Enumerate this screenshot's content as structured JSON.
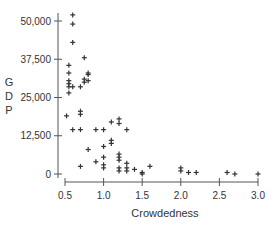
{
  "chart_data": {
    "type": "scatter",
    "title": "",
    "xlabel": "Crowdedness",
    "ylabel": "GDP",
    "ylabel_letters": [
      "G",
      "D",
      "P"
    ],
    "xlim": [
      0.5,
      3.0
    ],
    "ylim": [
      0,
      50000
    ],
    "x_ticks": [
      0.5,
      1.0,
      1.5,
      2.0,
      2.5,
      3.0
    ],
    "x_tick_labels": [
      "0.5",
      "1.0",
      "1.5",
      "2.0",
      "2.5",
      "3.0"
    ],
    "y_ticks": [
      0,
      12500,
      25000,
      37500,
      50000
    ],
    "y_tick_labels": [
      "0",
      "12,500",
      "25,000",
      "37,500",
      "50,000"
    ],
    "grid": false,
    "legend": null,
    "marker": "+",
    "marker_color": "#333333",
    "points": [
      [
        0.6,
        52000
      ],
      [
        0.6,
        49000
      ],
      [
        0.6,
        43000
      ],
      [
        0.55,
        35500
      ],
      [
        0.55,
        33000
      ],
      [
        0.55,
        30500
      ],
      [
        0.55,
        29500
      ],
      [
        0.55,
        28500
      ],
      [
        0.55,
        26500
      ],
      [
        0.52,
        19000
      ],
      [
        0.6,
        28500
      ],
      [
        0.7,
        28500
      ],
      [
        0.75,
        38000
      ],
      [
        0.8,
        33000
      ],
      [
        0.8,
        30500
      ],
      [
        0.75,
        31000
      ],
      [
        0.75,
        30000
      ],
      [
        0.8,
        32500
      ],
      [
        0.7,
        20500
      ],
      [
        0.7,
        19500
      ],
      [
        0.7,
        14500
      ],
      [
        0.6,
        14500
      ],
      [
        0.9,
        14500
      ],
      [
        1.0,
        14500
      ],
      [
        0.8,
        8000
      ],
      [
        0.9,
        4000
      ],
      [
        0.7,
        2500
      ],
      [
        1.0,
        9000
      ],
      [
        1.0,
        5500
      ],
      [
        1.0,
        3000
      ],
      [
        1.0,
        2000
      ],
      [
        1.1,
        17000
      ],
      [
        1.1,
        11000
      ],
      [
        1.1,
        10000
      ],
      [
        1.2,
        18000
      ],
      [
        1.2,
        16500
      ],
      [
        1.3,
        14500
      ],
      [
        1.2,
        6500
      ],
      [
        1.2,
        5500
      ],
      [
        1.2,
        4500
      ],
      [
        1.2,
        2000
      ],
      [
        1.2,
        1000
      ],
      [
        1.3,
        3500
      ],
      [
        1.3,
        2000
      ],
      [
        1.3,
        1000
      ],
      [
        1.4,
        1500
      ],
      [
        1.5,
        500
      ],
      [
        1.5,
        0
      ],
      [
        1.6,
        2500
      ],
      [
        2.0,
        2000
      ],
      [
        2.0,
        1000
      ],
      [
        2.1,
        500
      ],
      [
        2.2,
        500
      ],
      [
        2.6,
        500
      ],
      [
        2.7,
        0
      ],
      [
        3.0,
        0
      ]
    ]
  }
}
